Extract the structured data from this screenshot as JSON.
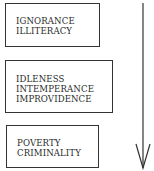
{
  "diagram": {
    "boxes": [
      {
        "lines": [
          "IGNORANCE",
          "ILLITERACY"
        ]
      },
      {
        "lines": [
          "IDLENESS",
          "INTEMPERANCE",
          "IMPROVIDENCE"
        ]
      },
      {
        "lines": [
          "POVERTY",
          "CRIMINALITY"
        ]
      }
    ],
    "arrow": {
      "direction": "down"
    }
  }
}
